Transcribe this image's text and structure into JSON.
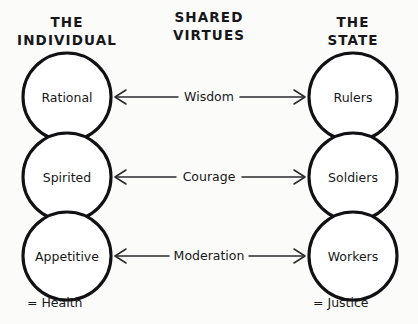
{
  "diagram": {
    "title_columns": {
      "left": {
        "line1": "THE",
        "line2": "INDIVIDUAL"
      },
      "center": {
        "line1": "SHARED",
        "line2": "VIRTUES"
      },
      "right": {
        "line1": "THE",
        "line2": "STATE"
      }
    },
    "rows": [
      {
        "left": "Rational",
        "virtue": "Wisdom",
        "right": "Rulers"
      },
      {
        "left": "Spirited",
        "virtue": "Courage",
        "right": "Soldiers"
      },
      {
        "left": "Appetitive",
        "virtue": "Moderation",
        "right": "Workers"
      }
    ],
    "footers": {
      "left": "= Health",
      "right": "= Justice"
    },
    "colors": {
      "background": "#fbfbf9",
      "stroke": "#111114",
      "connector": "#2b2b2f",
      "text": "#17171a",
      "circle_fill": "#ffffff"
    }
  }
}
